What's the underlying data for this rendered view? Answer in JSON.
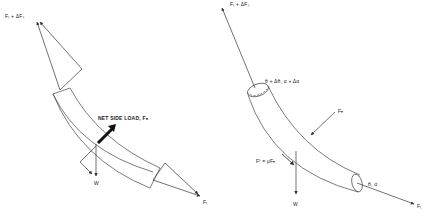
{
  "figure": {
    "type": "free-body diagram",
    "panels": [
      {
        "id": "left",
        "description": "Force vector diagram on curved pipe element",
        "labels": {
          "top_force": "Fₜ + ΔFₜ",
          "side_load": "NET SIDE LOAD, Fₙ",
          "weight": "W",
          "bottom_force": "Fₜ"
        }
      },
      {
        "id": "right",
        "description": "Forces acting on curved tubular element",
        "labels": {
          "top_force": "Fₜ + ΔFₜ",
          "top_angles": "θ + Δθ, α + Δα",
          "normal_force": "Fₙ",
          "friction": "Fᶠ = μFₙ",
          "weight": "W",
          "bottom_angles": "θ, α",
          "bottom_force": "Fₜ"
        }
      }
    ],
    "colors": {
      "line": "#333333",
      "background": "#ffffff"
    }
  }
}
